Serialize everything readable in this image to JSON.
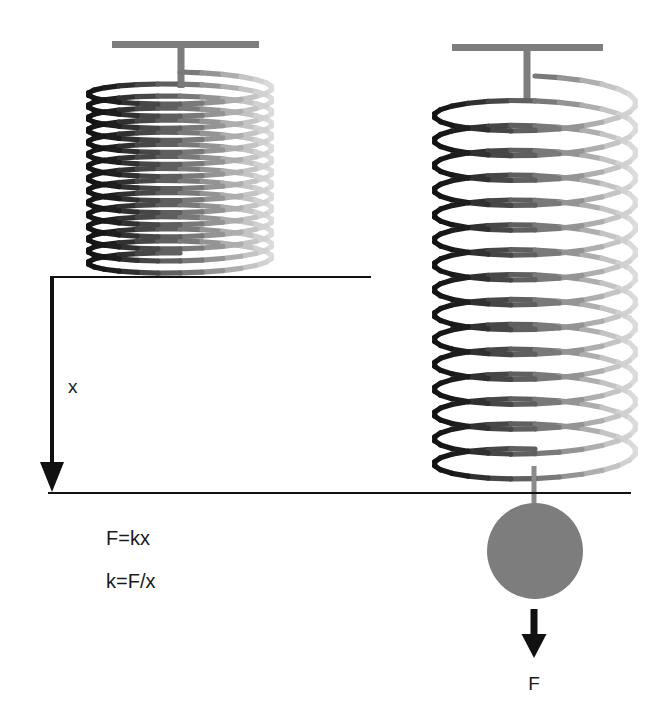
{
  "figure": {
    "background_color": "#ffffff",
    "width": 650,
    "height": 718
  },
  "labels": {
    "displacement": "x",
    "force": "F"
  },
  "formulas": {
    "line1": "F=kx",
    "line2": "k=F/x"
  },
  "springs": {
    "relaxed": {
      "name": "relaxed-spring",
      "state": "unstretched",
      "coil_count": 15,
      "center_x": 180,
      "top_y": 85,
      "bottom_y": 266,
      "radius_x": 92,
      "radius_y": 13,
      "dark_color": "#171717",
      "light_color": "#d9d9d9",
      "mount": {
        "bar_left": 112,
        "bar_right": 259,
        "bar_y": 41,
        "bar_thickness": 7,
        "stem_x": 181,
        "stem_width": 7,
        "stem_bottom": 88,
        "color": "#7d7d7d"
      }
    },
    "stretched": {
      "name": "stretched-spring",
      "state": "stretched",
      "coil_count": 15,
      "center_x": 535,
      "top_y": 97,
      "bottom_y": 470,
      "radius_x": 101,
      "radius_y": 21,
      "dark_color": "#171717",
      "light_color": "#d9d9d9",
      "mount": {
        "bar_left": 452,
        "bar_right": 603,
        "bar_y": 44,
        "bar_thickness": 7,
        "stem_x": 527,
        "stem_width": 7,
        "stem_bottom": 100,
        "color": "#7d7d7d"
      }
    }
  },
  "mass": {
    "name": "hanging-mass",
    "center_x": 535,
    "center_y": 551,
    "radius": 48,
    "color": "#7d7d7d",
    "connector": {
      "x": 534,
      "top": 466,
      "bottom": 505,
      "width": 5,
      "color": "#8a8a8a"
    }
  },
  "reference_lines": {
    "upper": {
      "name": "relaxed-reference-line",
      "x1": 50,
      "x2": 371,
      "y": 277,
      "color": "#111111",
      "thickness": 2
    },
    "lower": {
      "name": "stretched-reference-line",
      "x1": 48,
      "x2": 631,
      "y": 493,
      "color": "#111111",
      "thickness": 2
    }
  },
  "arrows": {
    "displacement": {
      "name": "displacement-arrow",
      "x": 52,
      "y_start": 278,
      "y_end": 492,
      "shaft_width": 4,
      "head_width": 24,
      "head_height": 30,
      "color": "#111111",
      "label_x": 68,
      "label_y": 393
    },
    "force": {
      "name": "force-arrow",
      "x": 534,
      "y_start": 609,
      "y_end": 658,
      "shaft_width": 7,
      "head_width": 25,
      "head_height": 24,
      "color": "#111111",
      "label_x": 534,
      "label_y": 690
    }
  },
  "text_positions": {
    "formula1_x": 106,
    "formula1_y": 545,
    "formula2_x": 106,
    "formula2_y": 588
  }
}
